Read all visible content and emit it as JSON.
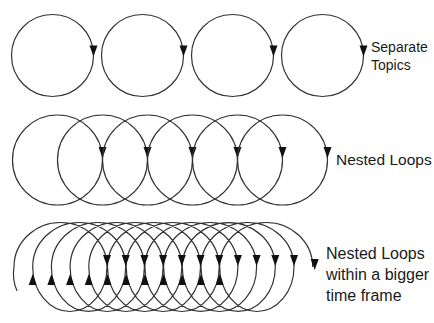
{
  "diagram": {
    "stroke_color": "#333333",
    "arrow_color": "#111111",
    "background": "#ffffff"
  },
  "rows": [
    {
      "name": "separate-topics",
      "label_lines": [
        "Separate",
        "Topics"
      ],
      "loop_count": 4,
      "cx_start": 52.5,
      "cx_step": 90,
      "cy": 55.5,
      "r": 41,
      "arrow_side": "right",
      "arrow_y_offset": -3
    },
    {
      "name": "nested-loops",
      "label_lines": [
        "Nested Loops"
      ],
      "loop_count": 6,
      "cx_start": 57.5,
      "cx_step": 45,
      "cy": 160,
      "r": 45,
      "arrow_side": "right",
      "arrow_y_offset": -6
    },
    {
      "name": "nested-loops-bigger-time-frame",
      "label_lines": [
        "Nested Loops",
        "within a bigger",
        "time frame"
      ],
      "loop_count": 12,
      "left_start": 14,
      "step": 18.7,
      "diameter": 93,
      "cy": 267,
      "ry": 44.5,
      "down_arrow_y": 262,
      "up_arrow_y": 278
    }
  ]
}
